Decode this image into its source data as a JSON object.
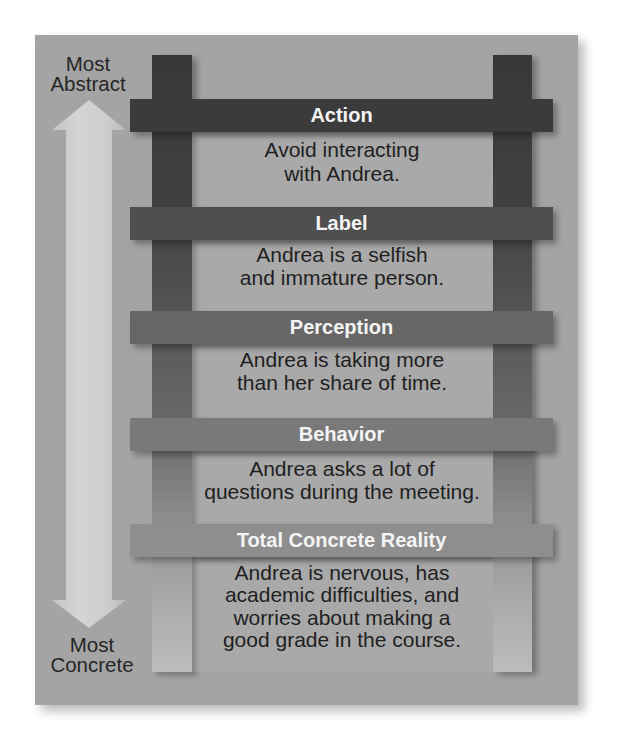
{
  "ladder": {
    "axis": {
      "top_label": [
        "Most",
        "Abstract"
      ],
      "bottom_label": [
        "Most",
        "Concrete"
      ],
      "arrow_icon": "double-headed-vertical-arrow"
    },
    "rungs": [
      {
        "title": "Action",
        "lines": [
          "Avoid interacting",
          "with Andrea."
        ]
      },
      {
        "title": "Label",
        "lines": [
          "Andrea is a selfish",
          "and immature person."
        ]
      },
      {
        "title": "Perception",
        "lines": [
          "Andrea is taking more",
          "than her share of time."
        ]
      },
      {
        "title": "Behavior",
        "lines": [
          "Andrea asks a lot of",
          "questions during the meeting."
        ]
      },
      {
        "title": "Total Concrete Reality",
        "lines": [
          "Andrea is nervous, has",
          "academic difficulties, and",
          "worries about making a",
          "good grade in the course."
        ]
      }
    ],
    "colors": {
      "panel": "#a4a4a4",
      "rung_action": "#3b3b3b",
      "rung_label": "#4f4f4f",
      "rung_perception": "#666666",
      "rung_behavior": "#797979",
      "rung_total_concrete_reality": "#8e8e8e",
      "title_text": "#f4f4f4",
      "body_text": "#1f1f1f"
    }
  }
}
